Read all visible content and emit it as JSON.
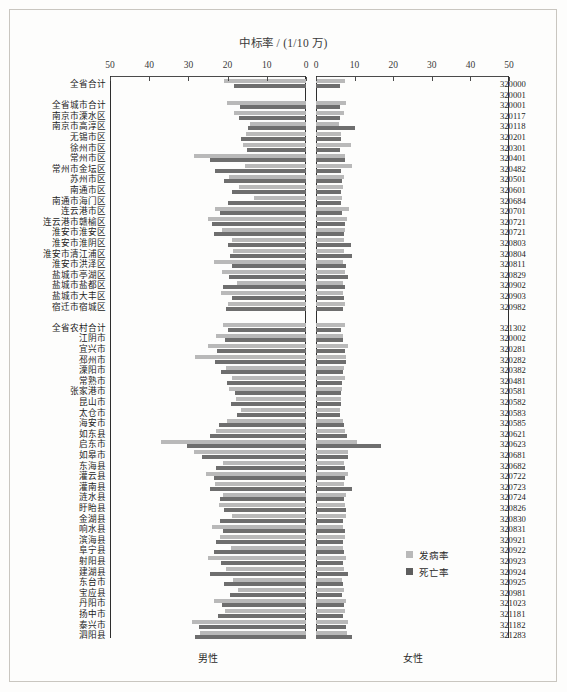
{
  "chart_data": {
    "type": "bar",
    "subtype": "paired-horizontal-population-pyramid",
    "title": "中标率 / (1/10 万)",
    "xlabel": "",
    "ylabel": "",
    "grid": false,
    "legend_position": "bottom-right",
    "panels": [
      {
        "name": "male",
        "label": "男性",
        "direction": "left",
        "xlim": [
          0,
          50
        ],
        "ticks": [
          50,
          40,
          30,
          20,
          10,
          0
        ]
      },
      {
        "name": "female",
        "label": "女性",
        "direction": "right",
        "xlim": [
          0,
          50
        ],
        "ticks": [
          0,
          10,
          20,
          30,
          40,
          50
        ]
      }
    ],
    "series": [
      {
        "name": "发病率",
        "key": "incidence",
        "color": "#b9b9b9"
      },
      {
        "name": "死亡率",
        "key": "mortality",
        "color": "#6e6e6e"
      }
    ],
    "categories": [
      {
        "label": "全省合计",
        "code": "320000",
        "group": "total",
        "male_incidence": 20.8,
        "male_mortality": 18.3,
        "female_incidence": 7.4,
        "female_mortality": 6.3
      },
      {
        "label": "",
        "code": "320001",
        "group": "spacer",
        "male_incidence": null,
        "male_mortality": null,
        "female_incidence": null,
        "female_mortality": null
      },
      {
        "label": "全省城市合计",
        "code": "320001",
        "group": "city",
        "male_incidence": 20.1,
        "male_mortality": 16.9,
        "female_incidence": 7.8,
        "female_mortality": 6.3
      },
      {
        "label": "南京市溧水区",
        "code": "320117",
        "group": "city",
        "male_incidence": 18.4,
        "male_mortality": 17.0,
        "female_incidence": 7.2,
        "female_mortality": 6.3
      },
      {
        "label": "南京市高淳区",
        "code": "320118",
        "group": "city",
        "male_incidence": 14.4,
        "male_mortality": 14.8,
        "female_incidence": 6.0,
        "female_mortality": 10.2
      },
      {
        "label": "无锡市区",
        "code": "320201",
        "group": "city",
        "male_incidence": 15.4,
        "male_mortality": 16.7,
        "female_incidence": 6.6,
        "female_mortality": 6.5
      },
      {
        "label": "徐州市区",
        "code": "320301",
        "group": "city",
        "male_incidence": 16.1,
        "male_mortality": 15.1,
        "female_incidence": 9.1,
        "female_mortality": 6.3
      },
      {
        "label": "常州市区",
        "code": "320401",
        "group": "city",
        "male_incidence": 28.5,
        "male_mortality": 24.6,
        "female_incidence": 7.5,
        "female_mortality": 7.6
      },
      {
        "label": "常州市金坛区",
        "code": "320482",
        "group": "city",
        "male_incidence": 15.6,
        "male_mortality": 23.2,
        "female_incidence": 9.2,
        "female_mortality": 6.6
      },
      {
        "label": "苏州市区",
        "code": "320501",
        "group": "city",
        "male_incidence": 19.6,
        "male_mortality": 21.0,
        "female_incidence": 7.2,
        "female_mortality": 6.8
      },
      {
        "label": "南通市区",
        "code": "320601",
        "group": "city",
        "male_incidence": 17.0,
        "male_mortality": 18.8,
        "female_incidence": 7.1,
        "female_mortality": 6.4
      },
      {
        "label": "南通市海门区",
        "code": "320684",
        "group": "city",
        "male_incidence": 13.3,
        "male_mortality": 19.9,
        "female_incidence": 6.8,
        "female_mortality": 6.5
      },
      {
        "label": "连云港市区",
        "code": "320701",
        "group": "city",
        "male_incidence": 23.3,
        "male_mortality": 22.0,
        "female_incidence": 8.6,
        "female_mortality": 6.8
      },
      {
        "label": "连云港市赣榆区",
        "code": "320721",
        "group": "city",
        "male_incidence": 24.9,
        "male_mortality": 24.0,
        "female_incidence": 8.0,
        "female_mortality": 7.5
      },
      {
        "label": "淮安市淮安区",
        "code": "320721",
        "group": "city",
        "male_incidence": 21.4,
        "male_mortality": 23.6,
        "female_incidence": 7.6,
        "female_mortality": 7.2
      },
      {
        "label": "淮安市淮阴区",
        "code": "320803",
        "group": "city",
        "male_incidence": 18.9,
        "male_mortality": 19.8,
        "female_incidence": 7.2,
        "female_mortality": 9.0
      },
      {
        "label": "淮安市清江浦区",
        "code": "320804",
        "group": "city",
        "male_incidence": 18.5,
        "male_mortality": 19.4,
        "female_incidence": 7.3,
        "female_mortality": 9.2
      },
      {
        "label": "淮安市洪泽区",
        "code": "320811",
        "group": "city",
        "male_incidence": 23.6,
        "male_mortality": 18.8,
        "female_incidence": 7.0,
        "female_mortality": 7.8
      },
      {
        "label": "盐城市亭湖区",
        "code": "320829",
        "group": "city",
        "male_incidence": 21.4,
        "male_mortality": 19.6,
        "female_incidence": 7.4,
        "female_mortality": 8.2
      },
      {
        "label": "盐城市盐都区",
        "code": "320902",
        "group": "city",
        "male_incidence": 17.7,
        "male_mortality": 21.3,
        "female_incidence": 6.9,
        "female_mortality": 7.5
      },
      {
        "label": "盐城市大丰区",
        "code": "320903",
        "group": "city",
        "male_incidence": 21.8,
        "male_mortality": 18.9,
        "female_incidence": 7.1,
        "female_mortality": 7.3
      },
      {
        "label": "宿迁市宿城区",
        "code": "320982",
        "group": "city",
        "male_incidence": 19.9,
        "male_mortality": 20.5,
        "female_incidence": 7.5,
        "female_mortality": 6.9
      },
      {
        "label": "",
        "code": "",
        "group": "spacer",
        "male_incidence": null,
        "male_mortality": null,
        "female_incidence": null,
        "female_mortality": null
      },
      {
        "label": "全省农村合计",
        "code": "321302",
        "group": "rural",
        "male_incidence": 21.1,
        "male_mortality": 19.8,
        "female_incidence": 7.5,
        "female_mortality": 6.6
      },
      {
        "label": "江阴市",
        "code": "320002",
        "group": "rural",
        "male_incidence": 22.9,
        "male_mortality": 20.6,
        "female_incidence": 7.1,
        "female_mortality": 7.0
      },
      {
        "label": "宜兴市",
        "code": "320281",
        "group": "rural",
        "male_incidence": 25.0,
        "male_mortality": 22.6,
        "female_incidence": 8.4,
        "female_mortality": 7.4
      },
      {
        "label": "邳州市",
        "code": "320282",
        "group": "rural",
        "male_incidence": 28.3,
        "male_mortality": 23.1,
        "female_incidence": 7.8,
        "female_mortality": 7.9
      },
      {
        "label": "溧阳市",
        "code": "320382",
        "group": "rural",
        "male_incidence": 20.4,
        "male_mortality": 21.6,
        "female_incidence": 7.2,
        "female_mortality": 7.0
      },
      {
        "label": "常熟市",
        "code": "320481",
        "group": "rural",
        "male_incidence": 18.9,
        "male_mortality": 20.1,
        "female_incidence": 7.4,
        "female_mortality": 6.8
      },
      {
        "label": "张家港市",
        "code": "320581",
        "group": "rural",
        "male_incidence": 19.7,
        "male_mortality": 18.2,
        "female_incidence": 6.8,
        "female_mortality": 6.5
      },
      {
        "label": "昆山市",
        "code": "320582",
        "group": "rural",
        "male_incidence": 17.8,
        "male_mortality": 19.1,
        "female_incidence": 6.6,
        "female_mortality": 6.4
      },
      {
        "label": "太仓市",
        "code": "320583",
        "group": "rural",
        "male_incidence": 16.6,
        "male_mortality": 17.5,
        "female_incidence": 6.3,
        "female_mortality": 6.2
      },
      {
        "label": "海安市",
        "code": "320585",
        "group": "rural",
        "male_incidence": 20.1,
        "male_mortality": 22.2,
        "female_incidence": 7.1,
        "female_mortality": 7.3
      },
      {
        "label": "如东县",
        "code": "320621",
        "group": "rural",
        "male_incidence": 22.9,
        "male_mortality": 24.5,
        "female_incidence": 7.6,
        "female_mortality": 8.0
      },
      {
        "label": "启东市",
        "code": "320623",
        "group": "rural",
        "male_incidence": 37.1,
        "male_mortality": 30.4,
        "female_incidence": 10.7,
        "female_mortality": 16.9
      },
      {
        "label": "如皋市",
        "code": "320681",
        "group": "rural",
        "male_incidence": 28.6,
        "male_mortality": 26.6,
        "female_incidence": 8.4,
        "female_mortality": 8.2
      },
      {
        "label": "东海县",
        "code": "320682",
        "group": "rural",
        "male_incidence": 21.1,
        "male_mortality": 23.0,
        "female_incidence": 7.3,
        "female_mortality": 7.6
      },
      {
        "label": "灌云县",
        "code": "320722",
        "group": "rural",
        "male_incidence": 25.6,
        "male_mortality": 23.4,
        "female_incidence": 8.3,
        "female_mortality": 7.6
      },
      {
        "label": "灌南县",
        "code": "320723",
        "group": "rural",
        "male_incidence": 23.1,
        "male_mortality": 24.4,
        "female_incidence": 7.2,
        "female_mortality": 9.3
      },
      {
        "label": "涟水县",
        "code": "320724",
        "group": "rural",
        "male_incidence": 21.1,
        "male_mortality": 22.0,
        "female_incidence": 7.7,
        "female_mortality": 7.2
      },
      {
        "label": "盱眙县",
        "code": "320826",
        "group": "rural",
        "male_incidence": 22.3,
        "male_mortality": 20.9,
        "female_incidence": 7.6,
        "female_mortality": 7.8
      },
      {
        "label": "金湖县",
        "code": "320830",
        "group": "rural",
        "male_incidence": 19.0,
        "male_mortality": 22.0,
        "female_incidence": 7.9,
        "female_mortality": 7.0
      },
      {
        "label": "响水县",
        "code": "320831",
        "group": "rural",
        "male_incidence": 24.1,
        "male_mortality": 21.2,
        "female_incidence": 7.1,
        "female_mortality": 7.4
      },
      {
        "label": "滨海县",
        "code": "320921",
        "group": "rural",
        "male_incidence": 21.9,
        "male_mortality": 22.9,
        "female_incidence": 7.5,
        "female_mortality": 7.1
      },
      {
        "label": "阜宁县",
        "code": "320922",
        "group": "rural",
        "male_incidence": 19.2,
        "male_mortality": 23.4,
        "female_incidence": 7.0,
        "female_mortality": 7.2
      },
      {
        "label": "射阳县",
        "code": "320923",
        "group": "rural",
        "male_incidence": 25.0,
        "male_mortality": 21.8,
        "female_incidence": 7.9,
        "female_mortality": 7.0
      },
      {
        "label": "建湖县",
        "code": "320924",
        "group": "rural",
        "male_incidence": 20.5,
        "male_mortality": 24.4,
        "female_incidence": 7.2,
        "female_mortality": 8.2
      },
      {
        "label": "东台市",
        "code": "320925",
        "group": "rural",
        "male_incidence": 18.7,
        "male_mortality": 21.0,
        "female_incidence": 6.8,
        "female_mortality": 7.1
      },
      {
        "label": "宝应县",
        "code": "320981",
        "group": "rural",
        "male_incidence": 17.4,
        "male_mortality": 19.4,
        "female_incidence": 7.3,
        "female_mortality": 6.7
      },
      {
        "label": "丹阳市",
        "code": "321023",
        "group": "rural",
        "male_incidence": 23.6,
        "male_mortality": 21.4,
        "female_incidence": 7.7,
        "female_mortality": 7.2
      },
      {
        "label": "扬中市",
        "code": "321181",
        "group": "rural",
        "male_incidence": 20.7,
        "male_mortality": 22.5,
        "female_incidence": 7.6,
        "female_mortality": 7.0
      },
      {
        "label": "泰兴市",
        "code": "321182",
        "group": "rural",
        "male_incidence": 29.2,
        "male_mortality": 27.4,
        "female_incidence": 8.4,
        "female_mortality": 7.9
      },
      {
        "label": "泗阳县",
        "code": "321283",
        "group": "rural",
        "male_incidence": 27.0,
        "male_mortality": 28.3,
        "female_incidence": 8.1,
        "female_mortality": 9.2
      }
    ]
  },
  "legend": {
    "items": [
      {
        "label": "发病率",
        "color": "#b9b9b9"
      },
      {
        "label": "死亡率",
        "color": "#5e5e5e"
      }
    ]
  },
  "sex_labels": {
    "male": "男性",
    "female": "女性"
  }
}
